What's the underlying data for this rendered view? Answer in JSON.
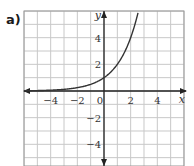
{
  "panel_label": "a)",
  "chart_data": {
    "type": "line",
    "title": "",
    "function": "y = 2^x",
    "xlabel": "x",
    "ylabel": "y",
    "xlim": [
      -6,
      6
    ],
    "ylim": [
      -5.5,
      6
    ],
    "grid": true,
    "x_ticks": [
      -4,
      -2,
      0,
      2,
      4
    ],
    "y_ticks": [
      4,
      2,
      -2,
      -4
    ],
    "x_tick_labels": [
      "−4",
      "−2",
      "0",
      "2",
      "4"
    ],
    "y_tick_labels": [
      "4",
      "2",
      "−2",
      "−4"
    ],
    "series": [
      {
        "name": "curve",
        "x": [
          -6,
          -5,
          -4,
          -3,
          -2,
          -1,
          0,
          1,
          2,
          2.5
        ],
        "y": [
          0.016,
          0.031,
          0.0625,
          0.125,
          0.25,
          0.5,
          1,
          2,
          4,
          5.66
        ]
      }
    ],
    "colors": {
      "curve": "#333333",
      "grid": "#c8c8c8",
      "axis": "#222222"
    }
  }
}
